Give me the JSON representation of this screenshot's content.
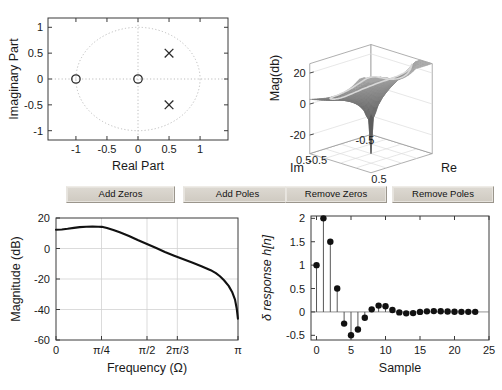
{
  "app": {
    "title": "Pole-Zero Filter Designer"
  },
  "buttons": [
    {
      "name": "add-zeros-button",
      "label": "Add Zeros",
      "x": 66,
      "width": 107
    },
    {
      "name": "add-poles-button",
      "label": "Add Poles",
      "x": 183,
      "width": 107
    },
    {
      "name": "remove-zeros-button",
      "label": "Remove Zeros",
      "x": 285,
      "width": 100
    },
    {
      "name": "remove-poles-button",
      "label": "Remove Poles",
      "x": 392,
      "width": 100
    }
  ],
  "chart_data": [
    {
      "id": "pole-zero-plot",
      "type": "scatter",
      "title": "",
      "xlabel": "Real Part",
      "ylabel": "Imaginary Part",
      "xlim": [
        -1.45,
        1.45
      ],
      "ylim": [
        -1.18,
        1.18
      ],
      "xticks": [
        -1,
        -0.5,
        0,
        0.5,
        1
      ],
      "xticklabels": [
        "-1",
        "-0.5",
        "0",
        "0.5",
        "1"
      ],
      "yticks": [
        -1,
        -0.5,
        0,
        0.5,
        1
      ],
      "yticklabels": [
        "-1",
        "-0.5",
        "0",
        "0.5",
        "1"
      ],
      "grid": false,
      "unit_circle": true,
      "legend": "none",
      "series": [
        {
          "name": "zeros",
          "marker": "o",
          "points": [
            {
              "re": -1,
              "im": 0
            },
            {
              "re": 0,
              "im": 0
            }
          ]
        },
        {
          "name": "poles",
          "marker": "x",
          "points": [
            {
              "re": 0.5,
              "im": 0.5
            },
            {
              "re": 0.5,
              "im": -0.5
            }
          ]
        }
      ]
    },
    {
      "id": "magnitude-surface-plot",
      "type": "surface",
      "title": "",
      "xlabel": "Re",
      "ylabel": "Im",
      "zlabel": "Mag(db)",
      "zticks": [
        -20,
        0,
        20
      ],
      "zticklabels": [
        "-20",
        "0",
        "20"
      ],
      "xticks": [
        -0.5,
        0.5
      ],
      "xticklabels": [
        "-0.5",
        "0.5"
      ],
      "yticks": [
        -0.5,
        0.5
      ],
      "yticklabels": [
        "0.5",
        "-0.5"
      ],
      "grid": true,
      "legend": "none",
      "description": "3-D magnitude of H(z) over the z-plane with unit-circle trace highlighted"
    },
    {
      "id": "magnitude-response-plot",
      "type": "line",
      "title": "",
      "xlabel": "Frequency (Ω)",
      "ylabel": "Magnitude (dB)",
      "xlim": [
        0,
        3.14159
      ],
      "ylim": [
        -60,
        20
      ],
      "xticks": [
        0,
        0.7854,
        1.5708,
        2.0944,
        3.14159
      ],
      "xticklabels": [
        "0",
        "π/4",
        "π/2",
        "2π/3",
        "π"
      ],
      "yticks": [
        -60,
        -40,
        -20,
        0,
        20
      ],
      "yticklabels": [
        "-60",
        "-40",
        "-20",
        "0",
        "20"
      ],
      "grid": true,
      "legend": "none",
      "x": [
        0.0,
        0.1,
        0.2,
        0.31,
        0.41,
        0.52,
        0.63,
        0.73,
        0.79,
        0.88,
        0.99,
        1.1,
        1.26,
        1.41,
        1.57,
        1.73,
        1.88,
        2.04,
        2.2,
        2.36,
        2.51,
        2.67,
        2.76,
        2.83,
        2.9,
        2.98,
        3.04,
        3.09,
        3.12,
        3.14
      ],
      "y": [
        12.3,
        12.5,
        12.9,
        13.5,
        14.0,
        14.3,
        14.4,
        14.3,
        14.2,
        13.4,
        12.1,
        10.6,
        8.2,
        5.6,
        3.0,
        0.3,
        -2.3,
        -4.7,
        -7.0,
        -9.3,
        -11.6,
        -14.2,
        -16.2,
        -18.2,
        -20.8,
        -24.5,
        -28.5,
        -33.5,
        -39.5,
        -46.0
      ]
    },
    {
      "id": "impulse-response-plot",
      "type": "stem",
      "title": "",
      "xlabel": "Sample",
      "ylabel": "δ response h[n]",
      "xlim": [
        -0.8,
        25
      ],
      "ylim": [
        -0.6,
        2.05
      ],
      "xticks": [
        0,
        5,
        10,
        15,
        20,
        25
      ],
      "xticklabels": [
        "0",
        "5",
        "10",
        "15",
        "20",
        "25"
      ],
      "yticks": [
        -0.5,
        0,
        0.5,
        1,
        1.5,
        2
      ],
      "yticklabels": [
        "-0.5",
        "0",
        "0.5",
        "1",
        "1.5",
        "2"
      ],
      "grid": false,
      "legend": "none",
      "samples": [
        0,
        1,
        2,
        3,
        4,
        5,
        6,
        7,
        8,
        9,
        10,
        11,
        12,
        13,
        14,
        15,
        16,
        17,
        18,
        19,
        20,
        21,
        22,
        23
      ],
      "values": [
        1.0,
        2.0,
        1.5,
        0.5,
        -0.25,
        -0.5,
        -0.375,
        -0.125,
        0.055,
        0.135,
        0.12,
        0.04,
        -0.01,
        -0.03,
        -0.025,
        0.0,
        0.012,
        0.018,
        0.015,
        0.008,
        0.003,
        0.002,
        0.002,
        0.002
      ]
    }
  ],
  "colors": {
    "background": "#ffffff",
    "axis": "#3a3a3a",
    "grid": "#d2d2d2",
    "curve": "#111111",
    "marker": "#2b2b2b",
    "unit_circle": "#bdbdbd",
    "button_face": "#d6d2ca",
    "surface_fill": "#6e6e6e",
    "surface_highlight": "#cfcfcf"
  }
}
